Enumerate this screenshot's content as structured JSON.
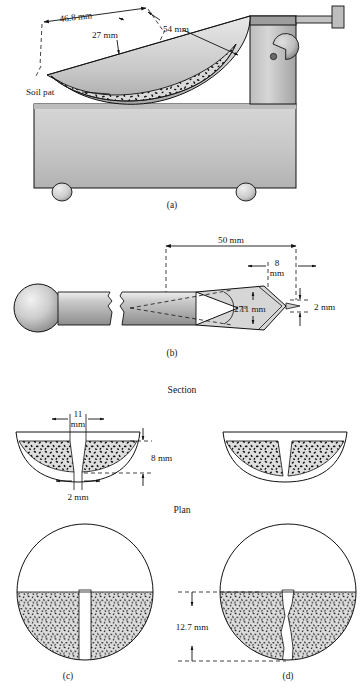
{
  "figure": {
    "title_parts": [
      "Section",
      "Plan"
    ],
    "captions": {
      "a": "(a)",
      "b": "(b)",
      "c": "(c)",
      "d": "(d)"
    },
    "section_label": "Section",
    "plan_label": "Plan"
  },
  "panel_a": {
    "caption": "(a)",
    "labels": {
      "width": "46.8 mm",
      "height": "27 mm",
      "length": "54 mm",
      "soil_pat": "Soil pat"
    }
  },
  "panel_b": {
    "caption": "(b)",
    "labels": {
      "length": "50 mm",
      "tip_width": "8\nmm",
      "tip_width_line1": "8",
      "tip_width_line2": "mm",
      "angle": "27°",
      "height": "11 mm",
      "thickness": "2 mm"
    }
  },
  "panel_c": {
    "caption": "(c)",
    "labels": {
      "groove_top_line1": "11",
      "groove_top_line2": "mm",
      "depth": "8 mm",
      "groove_bottom": "2 mm"
    }
  },
  "panel_d": {
    "caption": "(d)",
    "labels": {
      "closure_length": "12.7 mm"
    }
  },
  "colors": {
    "metal_light": "#d4d4d4",
    "metal_mid": "#b9b9b9",
    "metal_dark": "#9a9a9a",
    "soil_fill": "#d9d9d9",
    "speck": "#111111",
    "line": "#111111",
    "paper": "#ffffff"
  }
}
